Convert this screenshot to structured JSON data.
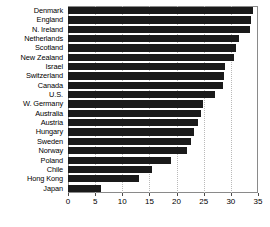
{
  "chart_data": {
    "type": "bar",
    "orientation": "horizontal",
    "title": "",
    "xlabel": "",
    "ylabel": "",
    "xlim": [
      0,
      35
    ],
    "xticks": [
      0,
      5,
      10,
      15,
      20,
      25,
      30,
      35
    ],
    "xtick_labels": [
      "0",
      "5",
      "10",
      "15",
      "20",
      "25",
      "30",
      "35"
    ],
    "grid": "vertical-dotted",
    "legend": "none",
    "bar_color": "#1a1a1a",
    "categories": [
      "Denmark",
      "England",
      "N. Ireland",
      "Netherlands",
      "Scotland",
      "New Zealand",
      "Israel",
      "Switzerland",
      "Canada",
      "U.S.",
      "W. Germany",
      "Australia",
      "Austria",
      "Hungary",
      "Sweden",
      "Norway",
      "Poland",
      "Chile",
      "Hong Kong",
      "Japan"
    ],
    "values": [
      34.0,
      33.8,
      33.5,
      31.5,
      31.0,
      30.5,
      29.0,
      28.7,
      28.5,
      27.0,
      24.8,
      24.5,
      24.0,
      23.2,
      22.6,
      22.0,
      19.0,
      15.5,
      13.0,
      6.0
    ]
  },
  "caption": {
    "text": ""
  }
}
